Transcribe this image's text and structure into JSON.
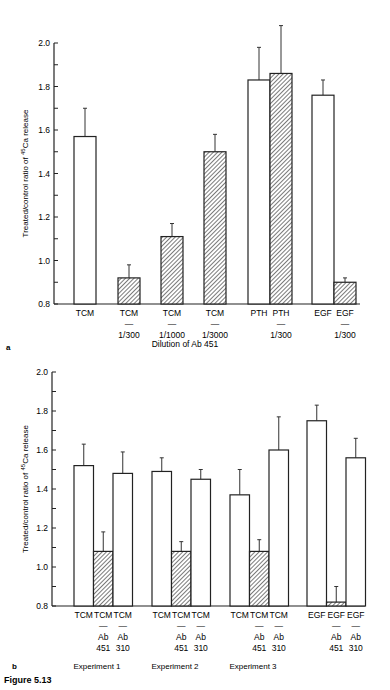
{
  "figure_label": "Figure 5.13",
  "chart_data": [
    {
      "panel": "a",
      "type": "bar",
      "title": "",
      "xlabel": "Dilution of Ab 451",
      "ylabel": "Treated/control ratio of 45Ca release",
      "ylabel_parts": {
        "pre": "Treated/control ratio of ",
        "sup": "45",
        "post": "Ca release"
      },
      "ylim": [
        0.8,
        2.0
      ],
      "yticks": [
        "0.8",
        "1.0",
        "1.2",
        "1.4",
        "1.6",
        "1.8",
        "2.0"
      ],
      "grid": false,
      "legend": "none (open bars = untreated agent, hatched = with antibody)",
      "categories": [
        {
          "line1": "TCM",
          "line2": "",
          "line3": ""
        },
        {
          "line1": "TCM",
          "line2": "—",
          "line3": "1/300"
        },
        {
          "line1": "TCM",
          "line2": "—",
          "line3": "1/1000"
        },
        {
          "line1": "TCM",
          "line2": "—",
          "line3": "1/3000"
        },
        {
          "line1": "PTH",
          "line2": "",
          "line3": ""
        },
        {
          "line1": "PTH",
          "line2": "—",
          "line3": "1/300"
        },
        {
          "line1": "EGF",
          "line2": "",
          "line3": ""
        },
        {
          "line1": "EGF",
          "line2": "—",
          "line3": "1/300"
        }
      ],
      "values": [
        1.57,
        0.92,
        1.11,
        1.5,
        1.83,
        1.86,
        1.76,
        0.9
      ],
      "errors": [
        0.13,
        0.06,
        0.06,
        0.08,
        0.15,
        0.22,
        0.07,
        0.02
      ],
      "hatched": [
        false,
        true,
        true,
        true,
        false,
        true,
        false,
        true
      ]
    },
    {
      "panel": "b",
      "type": "bar",
      "title": "",
      "xlabel": "",
      "ylabel": "Treated/control ratio of 45Ca release",
      "ylabel_parts": {
        "pre": "Treated/control ratio of ",
        "sup": "45",
        "post": "Ca release"
      },
      "ylim": [
        0.8,
        2.0
      ],
      "yticks": [
        "0.8",
        "1.0",
        "1.2",
        "1.4",
        "1.6",
        "1.8",
        "2.0"
      ],
      "grid": false,
      "groups": [
        "Experiment 1",
        "Experiment 2",
        "Experiment 3",
        ""
      ],
      "categories": [
        {
          "line1": "TCM",
          "line2": "",
          "line3": "",
          "line4": ""
        },
        {
          "line1": "TCM",
          "line2": "—",
          "line3": "Ab",
          "line4": "451"
        },
        {
          "line1": "TCM",
          "line2": "—",
          "line3": "Ab",
          "line4": "310"
        },
        {
          "line1": "TCM",
          "line2": "",
          "line3": "",
          "line4": ""
        },
        {
          "line1": "TCM",
          "line2": "—",
          "line3": "Ab",
          "line4": "451"
        },
        {
          "line1": "TCM",
          "line2": "—",
          "line3": "Ab",
          "line4": "310"
        },
        {
          "line1": "TCM",
          "line2": "",
          "line3": "",
          "line4": ""
        },
        {
          "line1": "TCM",
          "line2": "—",
          "line3": "Ab",
          "line4": "451"
        },
        {
          "line1": "TCM",
          "line2": "—",
          "line3": "Ab",
          "line4": "310"
        },
        {
          "line1": "EGF",
          "line2": "",
          "line3": "",
          "line4": ""
        },
        {
          "line1": "EGF",
          "line2": "—",
          "line3": "Ab",
          "line4": "451"
        },
        {
          "line1": "EGF",
          "line2": "—",
          "line3": "Ab",
          "line4": "310"
        }
      ],
      "values": [
        1.52,
        1.08,
        1.48,
        1.49,
        1.08,
        1.45,
        1.37,
        1.08,
        1.6,
        1.75,
        0.82,
        1.56
      ],
      "errors": [
        0.11,
        0.1,
        0.11,
        0.07,
        0.05,
        0.05,
        0.13,
        0.06,
        0.17,
        0.08,
        0.08,
        0.1
      ],
      "hatched": [
        false,
        true,
        false,
        false,
        true,
        false,
        false,
        true,
        false,
        false,
        true,
        false
      ]
    }
  ]
}
